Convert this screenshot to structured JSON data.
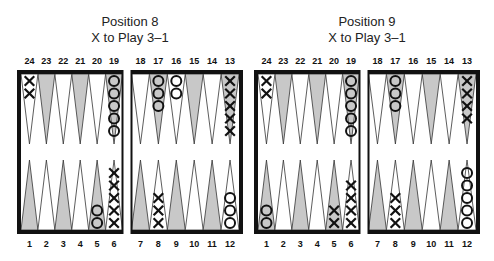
{
  "diagrams": [
    {
      "title": "Position 8",
      "subtitle": "X to Play 3–1",
      "top_labels": [
        "24",
        "23",
        "22",
        "21",
        "20",
        "19",
        "18",
        "17",
        "16",
        "15",
        "14",
        "13"
      ],
      "bottom_labels": [
        "1",
        "2",
        "3",
        "4",
        "5",
        "6",
        "7",
        "8",
        "9",
        "10",
        "11",
        "12"
      ],
      "checkers": {
        "24": {
          "player": "X",
          "count": 2
        },
        "19": {
          "player": "O",
          "count": 5
        },
        "17": {
          "player": "O",
          "count": 3
        },
        "16": {
          "player": "O",
          "count": 2
        },
        "13": {
          "player": "X",
          "count": 5
        },
        "5": {
          "player": "O",
          "count": 2
        },
        "6": {
          "player": "X",
          "count": 5
        },
        "8": {
          "player": "X",
          "count": 3
        },
        "12": {
          "player": "O",
          "count": 3
        }
      }
    },
    {
      "title": "Position 9",
      "subtitle": "X to Play 3–1",
      "top_labels": [
        "24",
        "23",
        "22",
        "21",
        "20",
        "19",
        "18",
        "17",
        "16",
        "15",
        "14",
        "13"
      ],
      "bottom_labels": [
        "1",
        "2",
        "3",
        "4",
        "5",
        "6",
        "7",
        "8",
        "9",
        "10",
        "11",
        "12"
      ],
      "checkers": {
        "24": {
          "player": "X",
          "count": 2
        },
        "19": {
          "player": "O",
          "count": 5
        },
        "17": {
          "player": "O",
          "count": 3
        },
        "13": {
          "player": "X",
          "count": 4
        },
        "1": {
          "player": "O",
          "count": 2
        },
        "5": {
          "player": "X",
          "count": 2
        },
        "6": {
          "player": "X",
          "count": 4
        },
        "8": {
          "player": "X",
          "count": 3
        },
        "12": {
          "player": "O",
          "count": 5
        }
      }
    }
  ],
  "colors": {
    "border": "#111111",
    "shaded_point": "#c8c8c8",
    "white_point": "#ffffff",
    "checker_stroke": "#111111"
  }
}
